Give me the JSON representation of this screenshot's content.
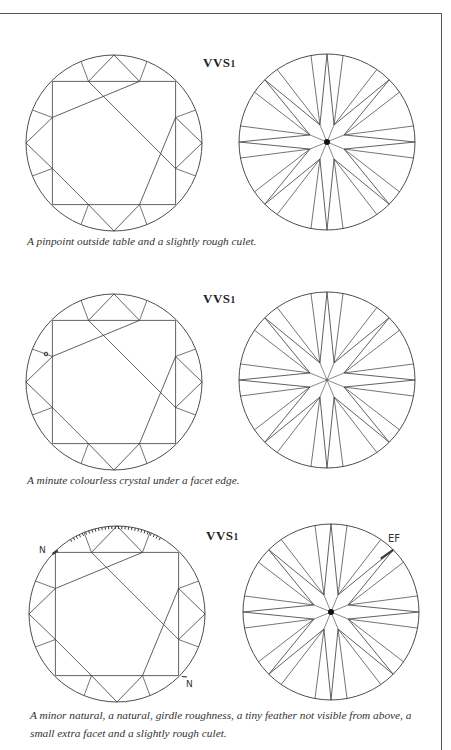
{
  "page": {
    "type": "gemmology clarity grading plates",
    "sections": [
      {
        "grade_label": "VVS",
        "grade_sub": "1",
        "caption": "A pinpoint outside table and a slightly rough culet.",
        "crown": {
          "cx": 114,
          "cy": 143,
          "r": 88
        },
        "pavilion": {
          "cx": 327,
          "cy": 142,
          "r": 88
        },
        "marks": {
          "crown_pinpoint": false,
          "culet_dot": true
        }
      },
      {
        "grade_label": "VVS",
        "grade_sub": "1",
        "caption": "A minute colourless crystal under a facet edge.",
        "crown": {
          "cx": 114,
          "cy": 382,
          "r": 88
        },
        "pavilion": {
          "cx": 327,
          "cy": 380,
          "r": 88
        },
        "marks": {
          "crystal": [
            46,
            354
          ],
          "culet_dot": false
        }
      },
      {
        "grade_label": "VVS",
        "grade_sub": "1",
        "caption_lines": [
          "A minor natural, a natural, girdle roughness, a tiny feather not visible from above, a",
          "small extra facet and a slightly rough culet."
        ],
        "crown": {
          "cx": 117,
          "cy": 614,
          "r": 88
        },
        "pavilion": {
          "cx": 331,
          "cy": 612,
          "r": 88
        },
        "annotations": [
          {
            "text": "N",
            "x": 39,
            "y": 553,
            "meaning": "minor natural"
          },
          {
            "text": "N",
            "x": 186,
            "y": 687,
            "meaning": "natural"
          },
          {
            "text": "EF",
            "x": 388,
            "y": 542,
            "meaning": "extra facet"
          }
        ],
        "marks": {
          "girdle_roughness_arc_deg": [
            -125,
            -60
          ],
          "culet_dot": true
        }
      }
    ]
  },
  "colors": {
    "line": "#3a3a3a",
    "text": "#2a2a2a",
    "frame": "#555555"
  }
}
